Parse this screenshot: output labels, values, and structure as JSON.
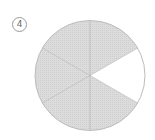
{
  "label": "4",
  "diagram": {
    "type": "circle-fraction",
    "total_sectors": 6,
    "shaded_sectors": 5,
    "unshaded_sectors": 1,
    "fraction_shaded": "5/6",
    "colors": {
      "shaded": "#d6d6d6",
      "unshaded": "#ffffff",
      "outline": "#bdbdbd",
      "divider": "#b0b0b0"
    }
  }
}
